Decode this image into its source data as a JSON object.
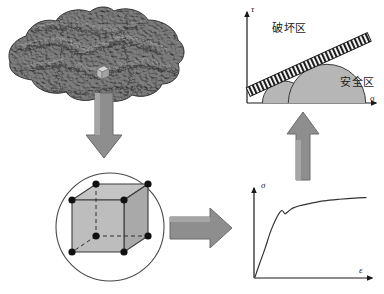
{
  "figure": {
    "background_color": "#ffffff",
    "width": 384,
    "height": 294
  },
  "labels": {
    "failure_zone": "破坏区",
    "safe_zone": "安全区",
    "tau": "τ",
    "sigma_shear_axis": "σ",
    "sigma_stress_axis": "σ",
    "epsilon": "ε"
  },
  "palette": {
    "rock_dark": "#4a4a4a",
    "rock_mid": "#6e6e6e",
    "rock_light": "#8f8f8f",
    "arrow_fill": "#8c8c8c",
    "arrow_stroke": "#6b6b6b",
    "circle_fill": "#b3b3b3",
    "cube_face_light": "#c9c9c9",
    "cube_face_mid": "#aaaaaa",
    "cube_face_dark": "#8f8f8f",
    "node_dot": "#111111",
    "axis_stroke": "#1a1a1a",
    "curve_stroke": "#333333",
    "hatch_stroke": "#1a1a1a"
  },
  "panels": {
    "rock_mass": {
      "name": "rock-mass-blob",
      "description": "Irregular textured rock mass outline with embedded sample cube",
      "sample_marker": "representative-element-cube"
    },
    "rev_cube": {
      "name": "representative-volume-element",
      "description": "Cube inscribed in a circle with eight highlighted vertex nodes",
      "vertex_count": 8,
      "hidden_edges": "dashed"
    },
    "arrows": [
      {
        "name": "arrow-rock-to-rev",
        "direction": "down"
      },
      {
        "name": "arrow-rev-to-curve",
        "direction": "right"
      },
      {
        "name": "arrow-curve-to-envelope",
        "direction": "up"
      }
    ]
  },
  "chart_data": [
    {
      "id": "mohr-coulomb-envelope",
      "type": "line",
      "title": "",
      "xlabel": "σ",
      "ylabel": "τ",
      "grid": false,
      "legend": null,
      "annotations": [
        {
          "text": "破坏区",
          "x": 0.28,
          "y": 0.88,
          "note": "failure zone above envelope"
        },
        {
          "text": "安全区",
          "x": 0.82,
          "y": 0.34,
          "note": "safe zone below envelope"
        }
      ],
      "series": [
        {
          "name": "failure-envelope",
          "style": "hatched-band",
          "x": [
            0.02,
            1.0
          ],
          "y": [
            0.18,
            0.8
          ]
        }
      ],
      "mohr_circles": [
        {
          "name": "circle-small",
          "center_x": 0.29,
          "radius": 0.17
        },
        {
          "name": "circle-large",
          "center_x": 0.62,
          "radius": 0.3
        }
      ],
      "xlim": [
        0,
        1
      ],
      "ylim": [
        0,
        1
      ]
    },
    {
      "id": "stress-strain-curve",
      "type": "line",
      "title": "",
      "xlabel": "ε",
      "ylabel": "σ",
      "grid": false,
      "legend": null,
      "series": [
        {
          "name": "sigma-epsilon",
          "x": [
            0.0,
            0.04,
            0.09,
            0.14,
            0.19,
            0.24,
            0.27,
            0.3,
            0.34,
            0.4,
            0.5,
            0.62,
            0.76,
            0.9,
            1.0
          ],
          "y": [
            0.0,
            0.16,
            0.35,
            0.56,
            0.72,
            0.82,
            0.78,
            0.81,
            0.85,
            0.88,
            0.91,
            0.94,
            0.96,
            0.975,
            0.98
          ]
        }
      ],
      "xlim": [
        0,
        1
      ],
      "ylim": [
        0,
        1
      ]
    }
  ]
}
